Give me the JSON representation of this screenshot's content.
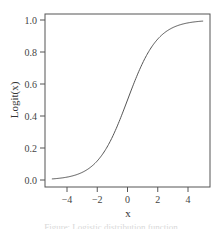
{
  "chart_data": {
    "type": "line",
    "title": "",
    "xlabel": "x",
    "ylabel": "Logit(x)",
    "xlim": [
      -5.3,
      5.3
    ],
    "ylim": [
      -0.04,
      1.04
    ],
    "xticks": [
      -4,
      -2,
      0,
      2,
      4
    ],
    "xtick_labels": [
      "−4",
      "−2",
      "0",
      "2",
      "4"
    ],
    "yticks": [
      0.0,
      0.2,
      0.4,
      0.6,
      0.8,
      1.0
    ],
    "ytick_labels": [
      "0.0",
      "0.2",
      "0.4",
      "0.6",
      "0.8",
      "1.0"
    ],
    "grid": false,
    "legend": null,
    "series": [
      {
        "name": "logistic",
        "x": [
          -5,
          -4.5,
          -4,
          -3.5,
          -3,
          -2.5,
          -2,
          -1.5,
          -1,
          -0.5,
          0,
          0.5,
          1,
          1.5,
          2,
          2.5,
          3,
          3.5,
          4,
          4.5,
          5
        ],
        "values": [
          0.0067,
          0.011,
          0.018,
          0.0293,
          0.0474,
          0.0759,
          0.1192,
          0.1824,
          0.2689,
          0.3775,
          0.5,
          0.6225,
          0.7311,
          0.8176,
          0.8808,
          0.9241,
          0.9526,
          0.9707,
          0.982,
          0.989,
          0.9933
        ]
      }
    ],
    "line_color": "#555555"
  },
  "caption": "Figure: Logistic distribution function"
}
